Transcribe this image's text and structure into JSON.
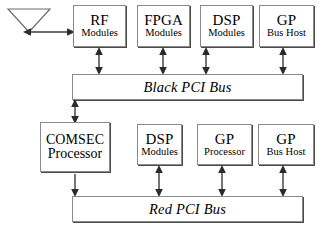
{
  "diagram": {
    "antenna": {
      "name": "antenna"
    },
    "top_row": [
      {
        "line1": "RF",
        "line2": "Modules",
        "dual": false
      },
      {
        "line1": "FPGA",
        "line2": "Modules",
        "dual": false
      },
      {
        "line1": "DSP",
        "line2": "Modules",
        "dual": false
      },
      {
        "line1": "GP",
        "line2": "Bus Host",
        "dual": false
      }
    ],
    "bottom_row": [
      {
        "line1": "COMSEC",
        "line2": "Processor",
        "dual": true
      },
      {
        "line1": "DSP",
        "line2": "Modules",
        "dual": false
      },
      {
        "line1": "GP",
        "line2": "Processor",
        "dual": false
      },
      {
        "line1": "GP",
        "line2": "Bus Host",
        "dual": false
      }
    ],
    "buses": [
      {
        "label": "Black PCI Bus"
      },
      {
        "label": "Red PCI Bus"
      }
    ],
    "colors": {
      "box_border": "#8a8a8a",
      "box_shadow": "#4a4a4a",
      "line": "#3a3a3a",
      "background": "#ffffff",
      "text": "#000000"
    }
  }
}
